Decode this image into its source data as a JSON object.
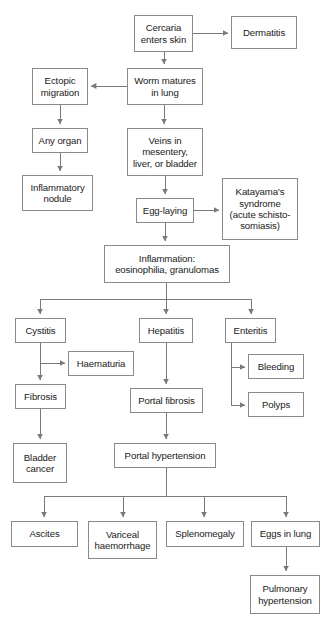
{
  "diagram": {
    "background": "#ffffff",
    "box_border_color": "#8a8a8a",
    "connector_color": "#7a7a7a",
    "text_color": "#1a1a1a",
    "nodes": [
      {
        "id": "cercaria",
        "label": "Cercaria\nenters skin",
        "x": 134,
        "y": 15,
        "w": 59,
        "h": 37
      },
      {
        "id": "dermatitis",
        "label": "Dermatitis",
        "x": 231,
        "y": 16,
        "w": 66,
        "h": 33
      },
      {
        "id": "ectopic",
        "label": "Ectopic\nmigration",
        "x": 32,
        "y": 68,
        "w": 56,
        "h": 37
      },
      {
        "id": "worm",
        "label": "Worm matures\nin lung",
        "x": 127,
        "y": 68,
        "w": 76,
        "h": 37
      },
      {
        "id": "any-organ",
        "label": "Any organ",
        "x": 32,
        "y": 128,
        "w": 56,
        "h": 25
      },
      {
        "id": "veins",
        "label": "Veins in\nmesentery,\nliver, or bladder",
        "x": 127,
        "y": 128,
        "w": 76,
        "h": 48
      },
      {
        "id": "inflammatory-nodule",
        "label": "Inflammatory\nnodule",
        "x": 22,
        "y": 175,
        "w": 71,
        "h": 36
      },
      {
        "id": "egg-laying",
        "label": "Egg-laying",
        "x": 136,
        "y": 198,
        "w": 58,
        "h": 25
      },
      {
        "id": "katayama",
        "label": "Katayama's\nsyndrome\n(acute schisto-\nsomiasis)",
        "x": 222,
        "y": 178,
        "w": 76,
        "h": 62
      },
      {
        "id": "inflammation",
        "label": "Inflammation:\neosinophilia, granulomas",
        "x": 104,
        "y": 245,
        "w": 126,
        "h": 38
      },
      {
        "id": "cystitis",
        "label": "Cystitis",
        "x": 15,
        "y": 318,
        "w": 51,
        "h": 25
      },
      {
        "id": "hepatitis",
        "label": "Hepatitis",
        "x": 139,
        "y": 318,
        "w": 54,
        "h": 25
      },
      {
        "id": "enteritis",
        "label": "Enteritis",
        "x": 225,
        "y": 318,
        "w": 51,
        "h": 25
      },
      {
        "id": "haematuria",
        "label": "Haematuria",
        "x": 68,
        "y": 351,
        "w": 66,
        "h": 25
      },
      {
        "id": "bleeding",
        "label": "Bleeding",
        "x": 248,
        "y": 354,
        "w": 56,
        "h": 25
      },
      {
        "id": "fibrosis",
        "label": "Fibrosis",
        "x": 15,
        "y": 384,
        "w": 51,
        "h": 25
      },
      {
        "id": "portal-fibrosis",
        "label": "Portal fibrosis",
        "x": 130,
        "y": 388,
        "w": 73,
        "h": 25
      },
      {
        "id": "polyps",
        "label": "Polyps",
        "x": 248,
        "y": 392,
        "w": 56,
        "h": 25
      },
      {
        "id": "bladder-cancer",
        "label": "Bladder\ncancer",
        "x": 13,
        "y": 443,
        "w": 54,
        "h": 40
      },
      {
        "id": "portal-hypertension",
        "label": "Portal hypertension",
        "x": 114,
        "y": 443,
        "w": 102,
        "h": 25
      },
      {
        "id": "ascites",
        "label": "Ascites",
        "x": 11,
        "y": 521,
        "w": 67,
        "h": 26
      },
      {
        "id": "variceal",
        "label": "Variceal\nhaemorrhage",
        "x": 88,
        "y": 521,
        "w": 69,
        "h": 38
      },
      {
        "id": "splenomegaly",
        "label": "Splenomegaly",
        "x": 166,
        "y": 521,
        "w": 78,
        "h": 26
      },
      {
        "id": "eggs-in-lung",
        "label": "Eggs in lung",
        "x": 251,
        "y": 521,
        "w": 69,
        "h": 26
      },
      {
        "id": "pulmonary",
        "label": "Pulmonary\nhypertension",
        "x": 250,
        "y": 575,
        "w": 70,
        "h": 39
      }
    ],
    "edges": [
      {
        "from": "cercaria",
        "to": "dermatitis",
        "kind": "horizontal-right"
      },
      {
        "from": "cercaria",
        "to": "worm",
        "kind": "vertical-down"
      },
      {
        "from": "worm",
        "to": "ectopic",
        "kind": "horizontal-left"
      },
      {
        "from": "worm",
        "to": "veins",
        "kind": "vertical-down"
      },
      {
        "from": "ectopic",
        "to": "any-organ",
        "kind": "vertical-down"
      },
      {
        "from": "any-organ",
        "to": "inflammatory-nodule",
        "kind": "vertical-down"
      },
      {
        "from": "veins",
        "to": "egg-laying",
        "kind": "vertical-down"
      },
      {
        "from": "egg-laying",
        "to": "katayama",
        "kind": "horizontal-right"
      },
      {
        "from": "egg-laying",
        "to": "inflammation",
        "kind": "vertical-down"
      },
      {
        "from": "inflammation",
        "to": "cystitis",
        "kind": "bus-down"
      },
      {
        "from": "inflammation",
        "to": "hepatitis",
        "kind": "bus-down"
      },
      {
        "from": "inflammation",
        "to": "enteritis",
        "kind": "bus-down"
      },
      {
        "from": "cystitis",
        "to": "haematuria",
        "kind": "tee-right"
      },
      {
        "from": "cystitis",
        "to": "fibrosis",
        "kind": "vertical-down"
      },
      {
        "from": "fibrosis",
        "to": "bladder-cancer",
        "kind": "vertical-down"
      },
      {
        "from": "hepatitis",
        "to": "portal-fibrosis",
        "kind": "vertical-down"
      },
      {
        "from": "portal-fibrosis",
        "to": "portal-hypertension",
        "kind": "vertical-down"
      },
      {
        "from": "enteritis",
        "to": "bleeding",
        "kind": "elbow-right"
      },
      {
        "from": "enteritis",
        "to": "polyps",
        "kind": "elbow-right"
      },
      {
        "from": "portal-hypertension",
        "to": "ascites",
        "kind": "bus-down"
      },
      {
        "from": "portal-hypertension",
        "to": "variceal",
        "kind": "bus-down"
      },
      {
        "from": "portal-hypertension",
        "to": "splenomegaly",
        "kind": "bus-down"
      },
      {
        "from": "portal-hypertension",
        "to": "eggs-in-lung",
        "kind": "bus-down"
      },
      {
        "from": "eggs-in-lung",
        "to": "pulmonary",
        "kind": "vertical-down"
      }
    ]
  }
}
